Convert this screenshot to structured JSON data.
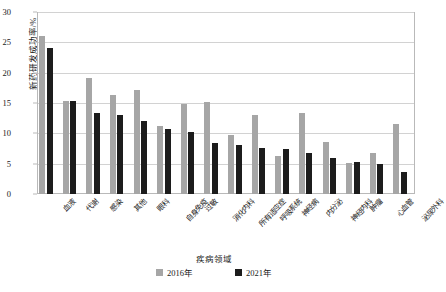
{
  "chart_data": {
    "type": "bar",
    "title": "",
    "xlabel": "疾病领域",
    "ylabel": "新药研发成功率/%",
    "ylim": [
      0,
      30
    ],
    "ytick_values": [
      0,
      5,
      10,
      15,
      20,
      25,
      30
    ],
    "ytick_labels": [
      "0",
      "5",
      "10",
      "15",
      "20",
      "25",
      "30"
    ],
    "grid": true,
    "legend_position": "bottom",
    "categories": [
      "血液",
      "代谢",
      "感染",
      "其他",
      "眼科",
      "自身免疫",
      "过敏",
      "消化内科",
      "所有适应症",
      "呼吸系统",
      "神经病",
      "内分泌",
      "神经内科",
      "肿瘤",
      "心血管",
      "泌尿外科"
    ],
    "series": [
      {
        "name": "2016年",
        "color": "#a6a6a6",
        "values": [
          26.1,
          15.3,
          19.2,
          16.3,
          17.1,
          11.2,
          14.8,
          15.2,
          9.8,
          13.1,
          6.3,
          13.4,
          8.6,
          5.1,
          6.8,
          11.5
        ]
      },
      {
        "name": "2021年",
        "color": "#1c1c1c",
        "values": [
          24.0,
          15.4,
          13.3,
          13.1,
          12.0,
          10.7,
          10.3,
          8.4,
          8.1,
          7.6,
          7.4,
          6.7,
          6.0,
          5.3,
          4.9,
          3.7
        ]
      }
    ]
  },
  "legend": {
    "items": [
      {
        "label": "2016年",
        "swatch": "s2016"
      },
      {
        "label": "2021年",
        "swatch": "s2021"
      }
    ]
  }
}
